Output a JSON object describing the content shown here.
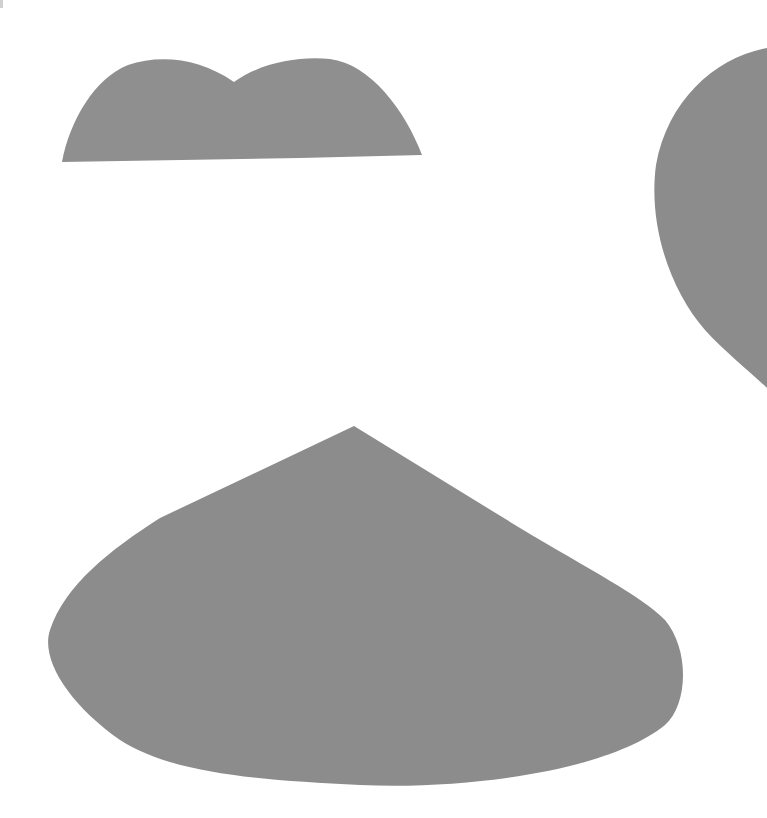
{
  "canvas": {
    "width": 767,
    "height": 818,
    "background": "#ffffff"
  },
  "shapes": [
    {
      "name": "double-hump-shape",
      "fill": "#8f8f8f"
    },
    {
      "name": "half-heart-shape",
      "fill": "#8c8c8c"
    },
    {
      "name": "rounded-cone-shape",
      "fill": "#8c8c8c"
    }
  ]
}
